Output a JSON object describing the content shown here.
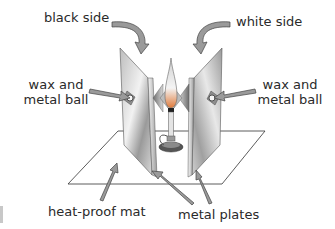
{
  "diagram": {
    "labels": {
      "black_side": "black side",
      "white_side": "white side",
      "wax_left_line1": "wax and",
      "wax_left_line2": "metal ball",
      "wax_right_line1": "wax and",
      "wax_right_line2": "metal ball",
      "heat_proof_mat": "heat-proof mat",
      "metal_plates": "metal plates"
    },
    "components": [
      "black side",
      "white side",
      "wax and metal ball",
      "wax and metal ball",
      "heat-proof mat",
      "metal plates",
      "bunsen burner flame"
    ],
    "colors": {
      "plate_light": "#e6e6e6",
      "plate_dark": "#8a8a8a",
      "arrow_fill": "#9a9a9a",
      "outline": "#333333",
      "text": "#2a2a2a"
    }
  }
}
